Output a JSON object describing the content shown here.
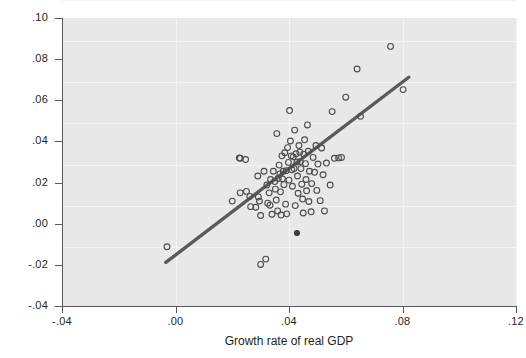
{
  "chart_data": {
    "type": "scatter",
    "title": "",
    "xlabel": "Growth rate of real GDP",
    "ylabel": "Growth rate of real currency",
    "xlim": [
      -0.04,
      0.12
    ],
    "ylim": [
      -0.04,
      0.1
    ],
    "xticks": [
      -0.04,
      0.0,
      0.04,
      0.08,
      0.12
    ],
    "xticklabels": [
      "-.04",
      ".00",
      ".04",
      ".08",
      ".12"
    ],
    "yticks": [
      -0.04,
      -0.02,
      0.0,
      0.02,
      0.04,
      0.06,
      0.08,
      0.1
    ],
    "yticklabels": [
      "-.04",
      "-.02",
      ".00",
      ".02",
      ".04",
      ".06",
      ".08",
      ".10"
    ],
    "grid": true,
    "grid_color": "#f4f4f4",
    "panel_color": "#e8e8e8",
    "marker": "open-circle",
    "marker_color": "#4c4c4c",
    "legend": null,
    "series": [
      {
        "name": "observations",
        "points": [
          [
            -0.003,
            -0.0112
          ],
          [
            0.02,
            0.011
          ],
          [
            0.0225,
            0.032
          ],
          [
            0.0228,
            0.0318
          ],
          [
            0.0247,
            0.0312
          ],
          [
            0.0228,
            0.015
          ],
          [
            0.025,
            0.0157
          ],
          [
            0.0262,
            0.0133
          ],
          [
            0.0265,
            0.0083
          ],
          [
            0.0283,
            0.008
          ],
          [
            0.029,
            0.0232
          ],
          [
            0.0292,
            0.013
          ],
          [
            0.0296,
            0.011
          ],
          [
            0.03,
            0.004
          ],
          [
            0.03,
            -0.0198
          ],
          [
            0.0312,
            0.0255
          ],
          [
            0.0318,
            -0.0172
          ],
          [
            0.0322,
            0.0188
          ],
          [
            0.0325,
            0.01
          ],
          [
            0.033,
            0.015
          ],
          [
            0.0333,
            0.009
          ],
          [
            0.0335,
            0.0215
          ],
          [
            0.034,
            0.0046
          ],
          [
            0.0345,
            0.0255
          ],
          [
            0.035,
            0.0205
          ],
          [
            0.0352,
            0.0168
          ],
          [
            0.0355,
            0.0115
          ],
          [
            0.0357,
            0.0438
          ],
          [
            0.036,
            0.0062
          ],
          [
            0.0362,
            0.022
          ],
          [
            0.0365,
            0.0285
          ],
          [
            0.0368,
            0.0242
          ],
          [
            0.037,
            0.0155
          ],
          [
            0.0372,
            0.0042
          ],
          [
            0.0375,
            0.033
          ],
          [
            0.0377,
            0.0218
          ],
          [
            0.038,
            0.0255
          ],
          [
            0.0382,
            0.019
          ],
          [
            0.0385,
            0.0345
          ],
          [
            0.0388,
            0.0095
          ],
          [
            0.039,
            0.0258
          ],
          [
            0.0392,
            0.0048
          ],
          [
            0.0395,
            0.037
          ],
          [
            0.0398,
            0.0298
          ],
          [
            0.04,
            0.0212
          ],
          [
            0.0402,
            0.055
          ],
          [
            0.0405,
            0.0402
          ],
          [
            0.0408,
            0.033
          ],
          [
            0.041,
            0.0262
          ],
          [
            0.0412,
            0.0182
          ],
          [
            0.0415,
            0.0325
          ],
          [
            0.0418,
            0.0268
          ],
          [
            0.042,
            0.0455
          ],
          [
            0.0422,
            0.0088
          ],
          [
            0.0425,
            0.034
          ],
          [
            0.0428,
            0.03
          ],
          [
            0.043,
            0.0232
          ],
          [
            0.0432,
            0.0148
          ],
          [
            0.0435,
            0.038
          ],
          [
            0.0438,
            0.0348
          ],
          [
            0.044,
            0.0302
          ],
          [
            0.0442,
            0.0268
          ],
          [
            0.0445,
            0.0192
          ],
          [
            0.0448,
            0.012
          ],
          [
            0.045,
            0.0052
          ],
          [
            0.0452,
            0.0338
          ],
          [
            0.0455,
            0.0408
          ],
          [
            0.0458,
            0.0292
          ],
          [
            0.046,
            0.0215
          ],
          [
            0.0462,
            0.016
          ],
          [
            0.0465,
            0.048
          ],
          [
            0.0468,
            0.0352
          ],
          [
            0.047,
            0.0108
          ],
          [
            0.0472,
            0.0255
          ],
          [
            0.0478,
            0.0058
          ],
          [
            0.048,
            0.0195
          ],
          [
            0.0485,
            0.0322
          ],
          [
            0.049,
            0.025
          ],
          [
            0.0495,
            0.038
          ],
          [
            0.0498,
            0.0162
          ],
          [
            0.0502,
            0.029
          ],
          [
            0.051,
            0.0112
          ],
          [
            0.0515,
            0.0368
          ],
          [
            0.052,
            0.0238
          ],
          [
            0.0525,
            0.0062
          ],
          [
            0.0532,
            0.0295
          ],
          [
            0.0545,
            0.0188
          ],
          [
            0.0552,
            0.0545
          ],
          [
            0.056,
            0.0318
          ],
          [
            0.0575,
            0.032
          ],
          [
            0.0585,
            0.0322
          ],
          [
            0.06,
            0.0615
          ],
          [
            0.064,
            0.0752
          ],
          [
            0.0652,
            0.0522
          ],
          [
            0.0758,
            0.0862
          ],
          [
            0.0802,
            0.0652
          ]
        ]
      },
      {
        "name": "filled-observation",
        "points": [
          [
            0.0428,
            -0.0045
          ]
        ]
      }
    ],
    "fit_line": {
      "name": "linear fit",
      "x_start": -0.0034,
      "y_start": -0.0188,
      "x_end": 0.0822,
      "y_end": 0.0712,
      "color": "#5a5a5a",
      "width": 3.4
    }
  }
}
